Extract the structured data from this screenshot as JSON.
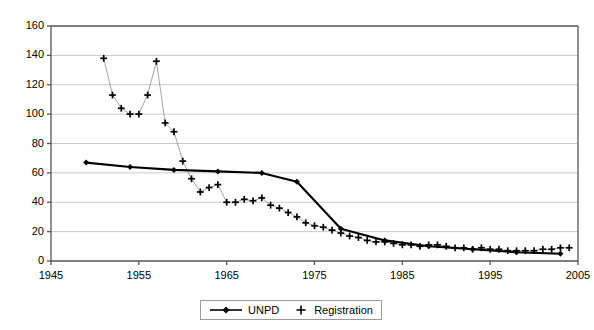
{
  "chart_data": {
    "type": "line",
    "title": "",
    "xlabel": "",
    "ylabel": "",
    "xlim": [
      1945,
      2005
    ],
    "ylim": [
      0,
      160
    ],
    "xticks": [
      1945,
      1955,
      1965,
      1975,
      1985,
      1995,
      2005
    ],
    "yticks": [
      0,
      20,
      40,
      60,
      80,
      100,
      120,
      140,
      160
    ],
    "grid": "horizontal",
    "legend_position": "bottom-center",
    "series": [
      {
        "name": "UNPD",
        "marker": "diamond",
        "line": "solid-thick",
        "color": "#000000",
        "x": [
          1949,
          1954,
          1959,
          1964,
          1969,
          1973,
          1978,
          1983,
          1988,
          1993,
          1998,
          2003
        ],
        "values": [
          67,
          64,
          62,
          61,
          60,
          54,
          22,
          14,
          10,
          8,
          6,
          5
        ]
      },
      {
        "name": "Registration",
        "marker": "plus",
        "line": "thin-grey",
        "color": "#000000",
        "x": [
          1951,
          1952,
          1953,
          1954,
          1955,
          1956,
          1957,
          1958,
          1959,
          1960,
          1961,
          1962,
          1963,
          1964,
          1965,
          1966,
          1967,
          1968,
          1969,
          1970,
          1971,
          1972,
          1973,
          1974,
          1975,
          1976,
          1977,
          1978,
          1979,
          1980,
          1981,
          1982,
          1983,
          1984,
          1985,
          1986,
          1987,
          1988,
          1989,
          1990,
          1991,
          1992,
          1993,
          1994,
          1995,
          1996,
          1997,
          1998,
          1999,
          2000,
          2001,
          2002,
          2003,
          2004
        ],
        "values": [
          138,
          113,
          104,
          100,
          100,
          113,
          136,
          94,
          88,
          68,
          56,
          47,
          50,
          52,
          40,
          40,
          42,
          41,
          43,
          38,
          36,
          33,
          30,
          26,
          24,
          23,
          21,
          19,
          17,
          16,
          14,
          13,
          13,
          12,
          11,
          11,
          10,
          11,
          11,
          10,
          9,
          9,
          8,
          9,
          8,
          8,
          7,
          7,
          7,
          7,
          8,
          8,
          9,
          9
        ]
      }
    ]
  },
  "legend": {
    "items": [
      {
        "label": "UNPD"
      },
      {
        "label": "Registration"
      }
    ]
  },
  "axes": {
    "x_tick_labels": [
      "1945",
      "1955",
      "1965",
      "1975",
      "1985",
      "1995",
      "2005"
    ],
    "y_tick_labels": [
      "0",
      "20",
      "40",
      "60",
      "80",
      "100",
      "120",
      "140",
      "160"
    ]
  }
}
